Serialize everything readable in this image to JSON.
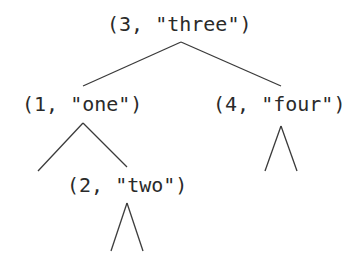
{
  "diagram": {
    "type": "binary-search-tree",
    "nodes": [
      {
        "id": "n3",
        "label": "(3, \"three\")",
        "key": 3,
        "value": "three"
      },
      {
        "id": "n1",
        "label": "(1, \"one\")",
        "key": 1,
        "value": "one"
      },
      {
        "id": "n4",
        "label": "(4, \"four\")",
        "key": 4,
        "value": "four"
      },
      {
        "id": "n2",
        "label": "(2, \"two\")",
        "key": 2,
        "value": "two"
      }
    ],
    "edges": [
      {
        "from": "n3",
        "to": "n1"
      },
      {
        "from": "n3",
        "to": "n4"
      },
      {
        "from": "n1",
        "to": "empty-left"
      },
      {
        "from": "n1",
        "to": "n2"
      },
      {
        "from": "n4",
        "to": "empty-subtrees"
      },
      {
        "from": "n2",
        "to": "empty-subtrees"
      }
    ],
    "colors": {
      "text": "#2a2a2a",
      "line": "#3a3a3a",
      "background": "#ffffff"
    }
  }
}
